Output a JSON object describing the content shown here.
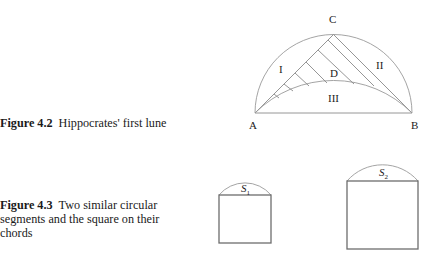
{
  "figures": [
    {
      "id": "fig-4-2",
      "caption": {
        "number": "Figure 4.2",
        "text": "Hippocrates' first lune"
      },
      "points": {
        "A": "A",
        "B": "B",
        "C": "C",
        "D": "D"
      },
      "regions": {
        "I": "I",
        "II": "II",
        "III": "III"
      }
    },
    {
      "id": "fig-4-3",
      "caption": {
        "number": "Figure 4.3",
        "text": "Two similar circular segments and the square on their chords"
      },
      "segments": {
        "s1": {
          "base": "S",
          "sub": "1"
        },
        "s2": {
          "base": "S",
          "sub": "2"
        }
      }
    }
  ]
}
